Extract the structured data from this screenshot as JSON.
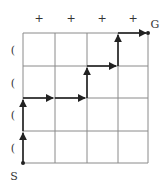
{
  "diagram": {
    "type": "lattice-path",
    "grid": {
      "cols": 4,
      "rows": 4,
      "line_color": "#8a8a8a",
      "path_color": "#222222"
    },
    "start_label": "S",
    "goal_label": "G",
    "top_markers": [
      "+",
      "+",
      "+",
      "+"
    ],
    "left_markers": [
      "(",
      "(",
      "(",
      "("
    ],
    "path": [
      [
        0,
        0
      ],
      [
        0,
        1
      ],
      [
        0,
        2
      ],
      [
        1,
        2
      ],
      [
        2,
        2
      ],
      [
        2,
        3
      ],
      [
        3,
        3
      ],
      [
        3,
        4
      ],
      [
        4,
        4
      ]
    ],
    "moves": [
      "U",
      "U",
      "R",
      "R",
      "U",
      "R",
      "U",
      "R"
    ]
  }
}
